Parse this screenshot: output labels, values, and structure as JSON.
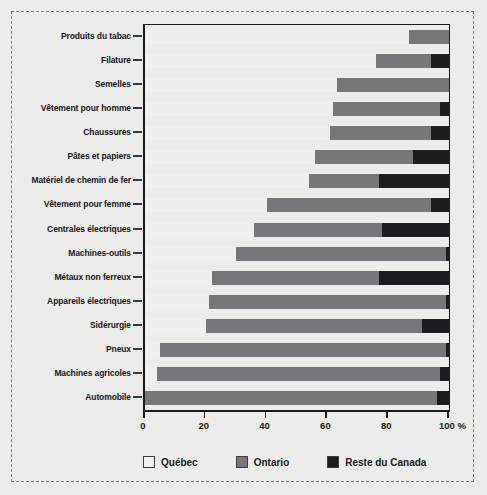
{
  "chart_data": {
    "type": "bar",
    "orientation": "horizontal",
    "stacked": true,
    "normalized_percent": true,
    "title": "",
    "subtitle": "",
    "xlabel": "",
    "ylabel": "",
    "xlim": [
      0,
      100
    ],
    "xticks": [
      0,
      20,
      40,
      60,
      80,
      100
    ],
    "xtick_labels": [
      "0",
      "20",
      "40",
      "60",
      "80",
      "100 %"
    ],
    "grid": false,
    "legend_position": "bottom",
    "categories": [
      "Produits du tabac",
      "Filature",
      "Semelles",
      "Vêtement pour homme",
      "Chaussures",
      "Pâtes et papiers",
      "Matériel de chemin de fer",
      "Vêtement pour femme",
      "Centrales électriques",
      "Machines-outils",
      "Métaux non ferreux",
      "Appareils électriques",
      "Sidérurgie",
      "Pneux",
      "Machines agricoles",
      "Automobile"
    ],
    "series": [
      {
        "name": "Québec",
        "color": "#f0f0ee",
        "values": [
          87,
          76,
          63,
          62,
          61,
          56,
          54,
          40,
          36,
          30,
          22,
          21,
          20,
          5,
          4,
          0
        ]
      },
      {
        "name": "Ontario",
        "color": "#77777a",
        "values": [
          13,
          18,
          37,
          35,
          33,
          32,
          23,
          54,
          42,
          69,
          55,
          78,
          71,
          94,
          93,
          96
        ]
      },
      {
        "name": "Reste du Canada",
        "color": "#1d1d1f",
        "values": [
          0,
          6,
          0,
          3,
          6,
          12,
          23,
          6,
          22,
          1,
          23,
          1,
          9,
          1,
          3,
          4
        ]
      }
    ]
  },
  "legend": {
    "items": [
      {
        "label": "Québec",
        "key": "qc"
      },
      {
        "label": "Ontario",
        "key": "on"
      },
      {
        "label": "Reste du Canada",
        "key": "rc"
      }
    ]
  }
}
